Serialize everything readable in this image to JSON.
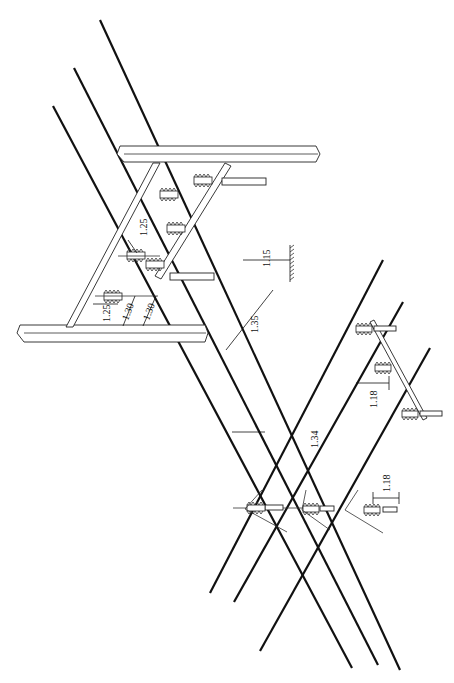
{
  "diagram": {
    "type": "line-crossing-clearance-drawing",
    "colors": {
      "line": "#111111",
      "background": "#ffffff"
    },
    "dimensions": [
      {
        "id": "d1",
        "label": "1.25",
        "note": "insulator pin spacing on upper crossarm"
      },
      {
        "id": "d2",
        "label": "1.25",
        "note": "lower crossarm pin offset"
      },
      {
        "id": "d3",
        "label": "1.30",
        "note": "phase spacing"
      },
      {
        "id": "d4",
        "label": "1.30",
        "note": "phase spacing"
      },
      {
        "id": "d5",
        "label": "1.15",
        "note": "clearance to ground symbol"
      },
      {
        "id": "d6",
        "label": "1.35",
        "note": "clearance between upper conductors"
      },
      {
        "id": "d7",
        "label": "1.34",
        "note": "clearance at crossing"
      },
      {
        "id": "d8",
        "label": "1.18",
        "note": "lower line phase spacing (right)"
      },
      {
        "id": "d9",
        "label": "1.18",
        "note": "lower line phase spacing (bottom)"
      }
    ],
    "components": {
      "upper_structure": "H-frame crossarms with pin insulators",
      "lower_structure": "single crossarm with three pin insulators",
      "ground_symbol": "hatched earth reference"
    }
  }
}
